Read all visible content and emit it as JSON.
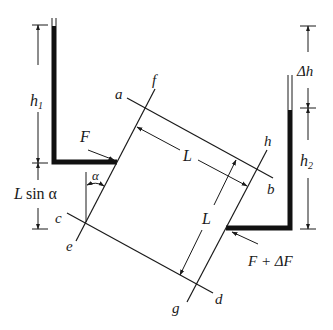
{
  "figure": {
    "type": "permeameter-schematic",
    "labels": {
      "h1": "h",
      "h1_sub": "1",
      "h2": "h",
      "h2_sub": "2",
      "delta_h": "Δh",
      "L_sin_alpha_L": "L",
      "L_sin_alpha_rest": "sin α",
      "alpha": "α",
      "F": "F",
      "F_plus_dF": "F + ΔF",
      "L_top": "L",
      "L_side": "L",
      "a": "a",
      "b": "b",
      "c": "c",
      "d": "d",
      "e": "e",
      "f": "f",
      "g": "g",
      "h": "h"
    },
    "colors": {
      "ink": "#1a1a1a",
      "background": "#ffffff"
    }
  }
}
